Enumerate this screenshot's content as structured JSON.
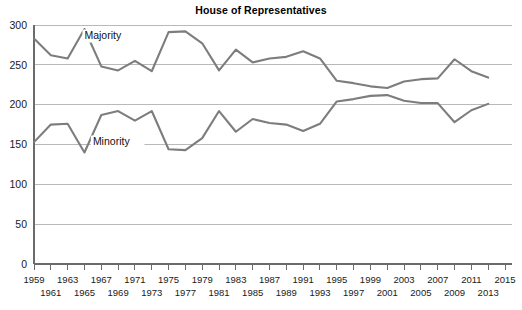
{
  "chart_data": {
    "type": "line",
    "title": "House of Representatives",
    "xlabel": "",
    "ylabel": "",
    "xlim": [
      1959,
      2015
    ],
    "ylim": [
      0,
      300
    ],
    "grid": true,
    "legend_position": "inline-annotation",
    "x": [
      1959,
      1961,
      1963,
      1965,
      1967,
      1969,
      1971,
      1973,
      1975,
      1977,
      1979,
      1981,
      1983,
      1985,
      1987,
      1989,
      1991,
      1993,
      1995,
      1997,
      1999,
      2001,
      2003,
      2005,
      2007,
      2009,
      2011,
      2013
    ],
    "xticks": [
      1959,
      1961,
      1963,
      1965,
      1967,
      1969,
      1971,
      1973,
      1975,
      1977,
      1979,
      1981,
      1983,
      1985,
      1987,
      1989,
      1991,
      1993,
      1995,
      1997,
      1999,
      2001,
      2003,
      2005,
      2007,
      2009,
      2011,
      2013,
      2015
    ],
    "xticks_upper": [
      1959,
      1963,
      1967,
      1971,
      1975,
      1979,
      1983,
      1987,
      1991,
      1995,
      1999,
      2003,
      2007,
      2011,
      2015
    ],
    "xticks_lower": [
      1961,
      1965,
      1969,
      1973,
      1977,
      1981,
      1985,
      1989,
      1993,
      1997,
      2001,
      2005,
      2009,
      2013
    ],
    "yticks": [
      0,
      50,
      100,
      150,
      200,
      250,
      300
    ],
    "series": [
      {
        "name": "Majority",
        "color": "#7d7d7d",
        "label_x": 1965,
        "label_y": 283,
        "values": [
          283,
          262,
          258,
          295,
          248,
          243,
          255,
          242,
          291,
          292,
          277,
          243,
          269,
          253,
          258,
          260,
          267,
          258,
          230,
          227,
          223,
          221,
          229,
          232,
          233,
          257,
          242,
          234
        ]
      },
      {
        "name": "Minority",
        "color": "#7d7d7d",
        "label_x": 1966,
        "label_y": 150,
        "values": [
          153,
          175,
          176,
          140,
          187,
          192,
          180,
          192,
          144,
          143,
          158,
          192,
          166,
          182,
          177,
          175,
          167,
          176,
          204,
          207,
          211,
          212,
          205,
          202,
          202,
          178,
          193,
          201
        ]
      }
    ]
  }
}
